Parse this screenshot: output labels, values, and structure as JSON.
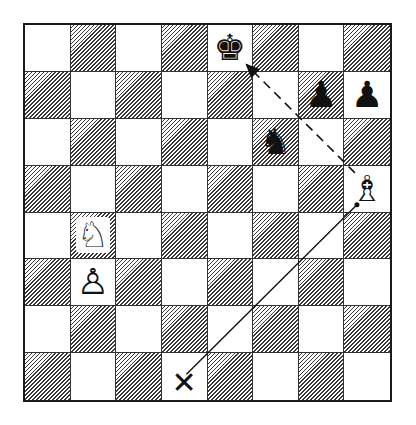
{
  "diagram": {
    "type": "chess-position",
    "orientation": "white-bottom",
    "files": [
      "a",
      "b",
      "c",
      "d",
      "e",
      "f",
      "g",
      "h"
    ],
    "ranks": [
      8,
      7,
      6,
      5,
      4,
      3,
      2,
      1
    ],
    "top_left_square_color": "light",
    "pieces": [
      {
        "square": "e8",
        "color": "black",
        "type": "king",
        "glyph": "♚"
      },
      {
        "square": "g7",
        "color": "black",
        "type": "pawn",
        "glyph": "♟"
      },
      {
        "square": "h7",
        "color": "black",
        "type": "pawn",
        "glyph": "♟"
      },
      {
        "square": "f6",
        "color": "black",
        "type": "knight",
        "glyph": "♞"
      },
      {
        "square": "h5",
        "color": "white",
        "type": "bishop",
        "glyph": "♗"
      },
      {
        "square": "b4",
        "color": "white",
        "type": "knight",
        "glyph": "♘"
      },
      {
        "square": "b3",
        "color": "white",
        "type": "pawn",
        "glyph": "♙"
      }
    ],
    "markers": [
      {
        "square": "d1",
        "symbol": "✕",
        "meaning": "target-square"
      }
    ],
    "arrows": [
      {
        "from": "h5",
        "to": "e8",
        "style": "dashed",
        "arrowhead": true
      },
      {
        "from": "h5",
        "to": "d1",
        "style": "solid",
        "arrowhead": false
      }
    ],
    "colors": {
      "line": "#111111",
      "dark_square_hatch": "#3a3a3a",
      "light_square": "#ffffff"
    }
  }
}
